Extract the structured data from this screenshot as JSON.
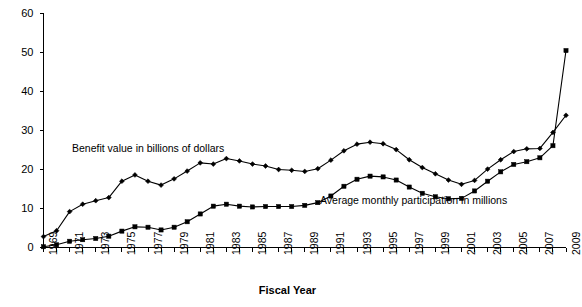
{
  "chart_data": {
    "type": "line",
    "title": "",
    "xlabel": "Fiscal Year",
    "ylabel": "",
    "grid": false,
    "legend_position": "inline-annotations",
    "xlim": [
      1969,
      2009
    ],
    "ylim": [
      0,
      60
    ],
    "y_ticks": [
      0,
      10,
      20,
      30,
      40,
      50,
      60
    ],
    "x_ticks": [
      1969,
      1971,
      1973,
      1975,
      1977,
      1979,
      1981,
      1983,
      1985,
      1987,
      1989,
      1991,
      1993,
      1995,
      1997,
      1999,
      2001,
      2003,
      2005,
      2007,
      2009
    ],
    "x": [
      1969,
      1970,
      1971,
      1972,
      1973,
      1974,
      1975,
      1976,
      1977,
      1978,
      1979,
      1980,
      1981,
      1982,
      1983,
      1984,
      1985,
      1986,
      1987,
      1988,
      1989,
      1990,
      1991,
      1992,
      1993,
      1994,
      1995,
      1996,
      1997,
      1998,
      1999,
      2000,
      2001,
      2002,
      2003,
      2004,
      2005,
      2006,
      2007,
      2008,
      2009
    ],
    "series": [
      {
        "name": "Benefit value in billions of dollars",
        "marker": "diamond",
        "values": [
          2.8,
          4.3,
          9.2,
          11.1,
          12.0,
          12.8,
          17.0,
          18.6,
          17.0,
          16.0,
          17.6,
          19.6,
          21.7,
          21.4,
          22.8,
          22.2,
          21.4,
          20.9,
          20.0,
          19.8,
          19.5,
          20.2,
          22.4,
          24.8,
          26.5,
          27.0,
          26.6,
          25.1,
          22.5,
          20.5,
          18.9,
          17.3,
          16.2,
          17.2,
          20.1,
          22.5,
          24.6,
          25.3,
          25.4,
          29.5,
          33.9
        ]
      },
      {
        "name": "Average monthly participation in millions",
        "marker": "square",
        "values": [
          0.2,
          0.7,
          1.6,
          2.0,
          2.3,
          2.9,
          4.2,
          5.3,
          5.2,
          4.5,
          5.2,
          6.6,
          8.6,
          10.6,
          11.1,
          10.6,
          10.4,
          10.5,
          10.5,
          10.5,
          10.8,
          11.5,
          13.2,
          15.7,
          17.5,
          18.3,
          18.1,
          17.3,
          15.5,
          13.9,
          13.0,
          12.5,
          12.6,
          14.5,
          17.0,
          19.4,
          21.3,
          22.0,
          23.0,
          26.1,
          50.5
        ]
      }
    ],
    "annotations": [
      {
        "text": "Benefit value in billions of dollars",
        "x_px": 72,
        "y_px": 142
      },
      {
        "text": "Average monthly participation in millions",
        "x_px": 320,
        "y_px": 194
      }
    ]
  },
  "axis": {
    "x_title": "Fiscal Year"
  },
  "caption": {
    "text": ""
  },
  "colors": {
    "line": "#000000",
    "axis": "#000000",
    "background": "#ffffff"
  }
}
